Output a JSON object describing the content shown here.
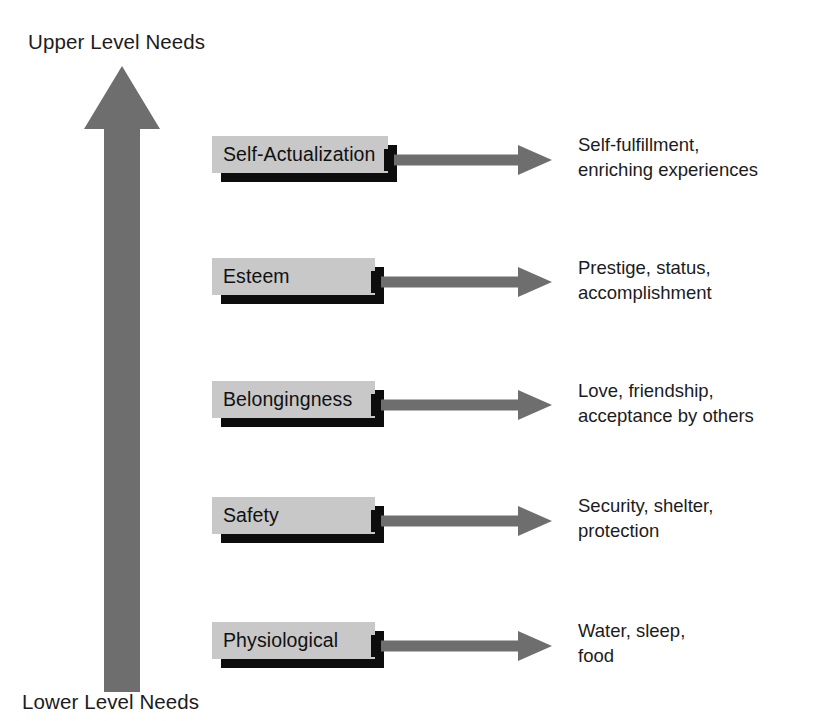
{
  "diagram": {
    "title_top": "Upper Level Needs",
    "title_bottom": "Lower Level Needs",
    "vertical_arrow": {
      "name": "upward-needs-arrow",
      "direction": "up",
      "color": "#6e6e6e"
    },
    "colors": {
      "box_fill": "#c8c8c8",
      "box_shadow": "#0d0d0d",
      "arrow_gray": "#6e6e6e",
      "text": "#1c1c1c"
    },
    "tiers": [
      {
        "id": "self-actualization",
        "label": "Self-Actualization",
        "desc_line1": "Self-fulfillment,",
        "desc_line2": "enriching experiences",
        "box_left": 212,
        "box_top": 136,
        "box_width": 176,
        "box_height": 37,
        "arrow_start": 388,
        "arrow_end": 552,
        "arrow_y": 160,
        "desc_left": 578,
        "desc_top": 132
      },
      {
        "id": "esteem",
        "label": "Esteem",
        "desc_line1": "Prestige, status,",
        "desc_line2": "accomplishment",
        "box_left": 212,
        "box_top": 258,
        "box_width": 163,
        "box_height": 37,
        "arrow_start": 375,
        "arrow_end": 552,
        "arrow_y": 282,
        "desc_left": 578,
        "desc_top": 255
      },
      {
        "id": "belongingness",
        "label": "Belongingness",
        "desc_line1": "Love, friendship,",
        "desc_line2": "acceptance by others",
        "box_left": 212,
        "box_top": 381,
        "box_width": 163,
        "box_height": 37,
        "arrow_start": 375,
        "arrow_end": 552,
        "arrow_y": 405,
        "desc_left": 578,
        "desc_top": 378
      },
      {
        "id": "safety",
        "label": "Safety",
        "desc_line1": "Security, shelter,",
        "desc_line2": "protection",
        "box_left": 212,
        "box_top": 497,
        "box_width": 163,
        "box_height": 37,
        "arrow_start": 375,
        "arrow_end": 552,
        "arrow_y": 521,
        "desc_left": 578,
        "desc_top": 493
      },
      {
        "id": "physiological",
        "label": "Physiological",
        "desc_line1": "Water, sleep,",
        "desc_line2": "food",
        "box_left": 212,
        "box_top": 622,
        "box_width": 163,
        "box_height": 37,
        "arrow_start": 375,
        "arrow_end": 552,
        "arrow_y": 646,
        "desc_left": 578,
        "desc_top": 618
      }
    ]
  }
}
